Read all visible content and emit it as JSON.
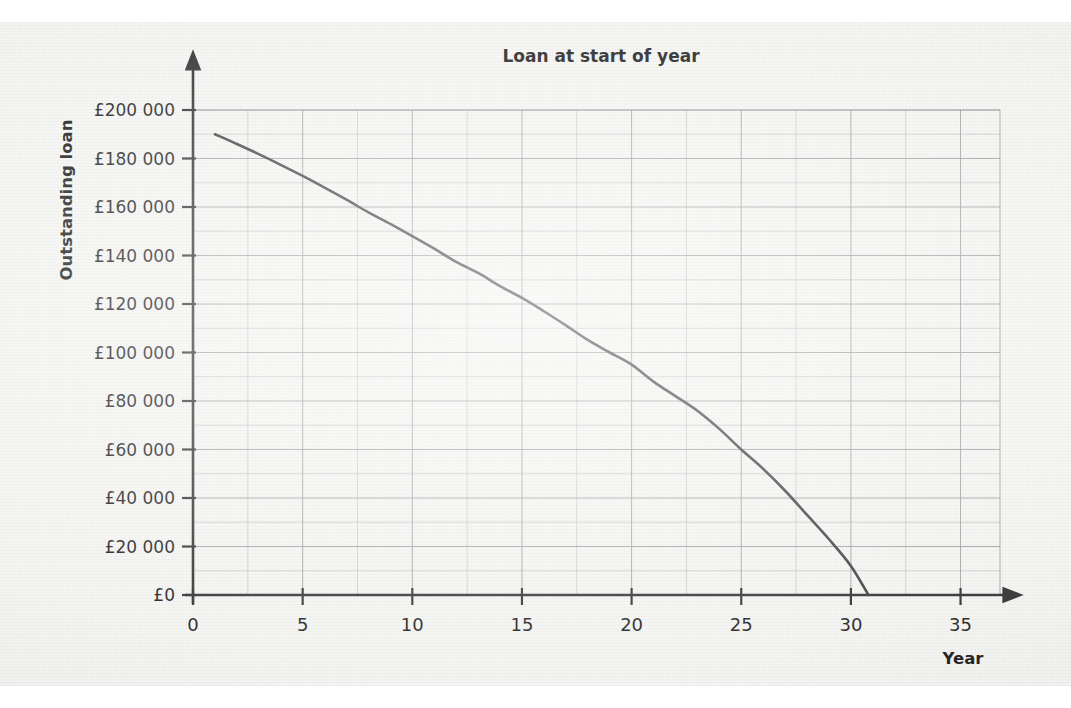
{
  "figure": {
    "background_color": "#f4f4f2",
    "ink_color": "#3a3a3a"
  },
  "chart_data": {
    "type": "line",
    "title": "Loan at start of year",
    "xlabel": "Year",
    "ylabel": "Outstanding loan",
    "xlim": [
      0,
      36.5
    ],
    "ylim": [
      0,
      205000
    ],
    "grid": true,
    "legend": "none",
    "x_ticks": [
      0,
      5,
      10,
      15,
      20,
      25,
      30,
      35
    ],
    "x_tick_labels": [
      "0",
      "5",
      "10",
      "15",
      "20",
      "25",
      "30",
      "35"
    ],
    "x_minor_gridline_step": 2.5,
    "y_ticks": [
      0,
      20000,
      40000,
      60000,
      80000,
      100000,
      120000,
      140000,
      160000,
      180000,
      200000
    ],
    "y_tick_labels": [
      "£0",
      "£20 000",
      "£40 000",
      "£60 000",
      "£80 000",
      "£100 000",
      "£120 000",
      "£140 000",
      "£160 000",
      "£180 000",
      "£200 000"
    ],
    "y_minor_gridline_step": 10000,
    "series": [
      {
        "name": "Outstanding loan",
        "color": "#3a3a3a",
        "line_width": 2.6,
        "x": [
          1,
          2,
          3,
          4,
          5,
          6,
          7,
          8,
          9,
          10,
          11,
          12,
          13,
          14,
          15,
          16,
          17,
          18,
          19,
          20,
          21,
          22,
          23,
          24,
          25,
          26,
          27,
          28,
          29,
          30,
          30.8
        ],
        "y": [
          190000,
          186000,
          181800,
          177400,
          172800,
          168000,
          163000,
          157800,
          153000,
          148000,
          142800,
          137400,
          132800,
          127400,
          122500,
          117000,
          111200,
          105200,
          100000,
          95000,
          88000,
          82000,
          76000,
          68500,
          60000,
          52000,
          43000,
          33000,
          23000,
          12000,
          0
        ]
      }
    ]
  },
  "annotations": {
    "x_axis_arrow": "arrow-right",
    "y_axis_arrow": "arrow-up",
    "curve_start_point": "(1, £190 000)",
    "curve_end_point": "(31, £0)"
  }
}
